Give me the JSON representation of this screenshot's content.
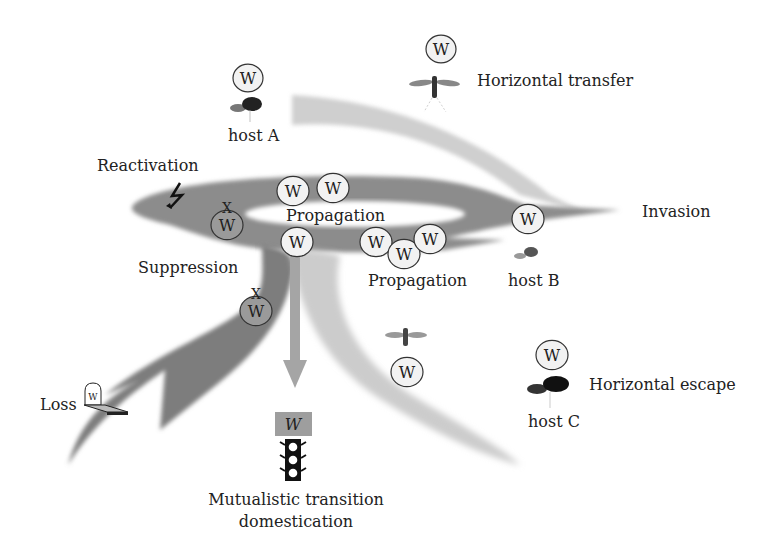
{
  "diagram": {
    "symbol": "W",
    "colors": {
      "dark_flow": "#8c8c8c",
      "darker_flow": "#6e6e6e",
      "light_flow": "#bdbdbd",
      "faint_flow": "#dcdcdc",
      "bubble_fill": "#f2f2f2",
      "bubble_dark_fill": "#9a9a9a",
      "text": "#222222"
    },
    "labels": {
      "host_a": "host A",
      "host_b": "host B",
      "host_c": "host C",
      "horizontal_transfer": "Horizontal transfer",
      "reactivation": "Reactivation",
      "propagation_top": "Propagation",
      "propagation_bottom": "Propagation",
      "invasion": "Invasion",
      "suppression": "Suppression",
      "loss": "Loss",
      "horizontal_escape": "Horizontal escape",
      "mutualistic_line1": "Mutualistic transition",
      "mutualistic_line2": "domestication"
    },
    "markers": {
      "suppressed": "X",
      "lightning": "reactivation-lightning-icon",
      "tombstone": "tombstone-icon",
      "traffic_light": "traffic-light-icon",
      "domesticated_box": "W"
    }
  }
}
